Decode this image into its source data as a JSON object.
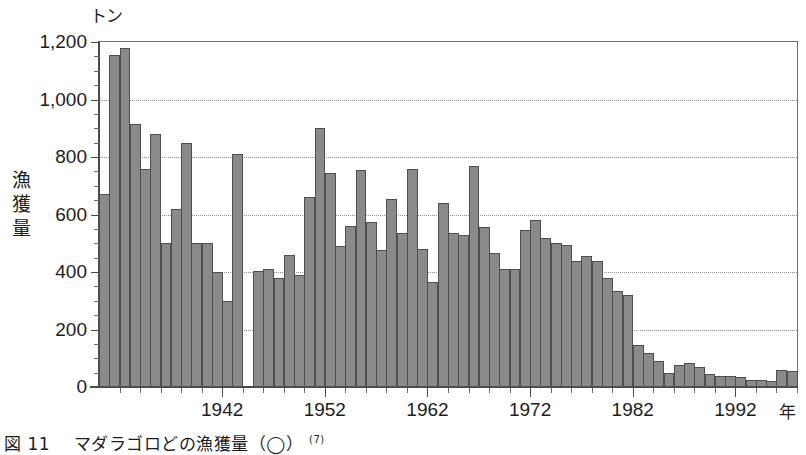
{
  "figure": {
    "caption_number": "図 11",
    "caption_text": "マダラゴロどの漁獲量（◯）",
    "caption_ref": "(7)"
  },
  "chart_data": {
    "type": "bar",
    "title": "",
    "subtitle": "",
    "xlabel": "年",
    "ylabel": "漁獲量",
    "yunit": "トン",
    "xunit": "年",
    "ylim": [
      0,
      1200
    ],
    "ytick_step": 200,
    "yticks": [
      0,
      200,
      400,
      600,
      800,
      1000,
      1200
    ],
    "ytick_labels": [
      "0",
      "200",
      "400",
      "600",
      "800",
      "1,000",
      "1,200"
    ],
    "yminor_step": 50,
    "xlim": [
      1931,
      1999
    ],
    "xticks": [
      1942,
      1952,
      1962,
      1972,
      1982,
      1992
    ],
    "xtick_labels": [
      "1942",
      "1952",
      "1962",
      "1972",
      "1982",
      "1992"
    ],
    "xminor_step": 2,
    "grid": true,
    "grid_axis": "y",
    "legend": "none",
    "bar_color": "#8a8a8a",
    "bar_edge_color": "#4f4f4f",
    "x": [
      1931,
      1932,
      1933,
      1934,
      1935,
      1936,
      1937,
      1938,
      1939,
      1940,
      1941,
      1942,
      1943,
      1944,
      1945,
      1946,
      1947,
      1948,
      1949,
      1950,
      1951,
      1952,
      1953,
      1954,
      1955,
      1956,
      1957,
      1958,
      1959,
      1960,
      1961,
      1962,
      1963,
      1964,
      1965,
      1966,
      1967,
      1968,
      1969,
      1970,
      1971,
      1972,
      1973,
      1974,
      1975,
      1976,
      1977,
      1978,
      1979,
      1980,
      1981,
      1982,
      1983,
      1984,
      1985,
      1986,
      1987,
      1988,
      1989,
      1990,
      1991,
      1992,
      1993,
      1994,
      1995,
      1996,
      1997,
      1998
    ],
    "values": [
      670,
      1155,
      1180,
      915,
      760,
      880,
      500,
      620,
      850,
      500,
      500,
      400,
      300,
      810,
      0,
      405,
      410,
      380,
      460,
      390,
      660,
      900,
      745,
      490,
      560,
      755,
      575,
      475,
      655,
      535,
      760,
      480,
      365,
      640,
      535,
      530,
      770,
      555,
      465,
      410,
      410,
      545,
      580,
      520,
      500,
      495,
      440,
      455,
      440,
      380,
      335,
      320,
      145,
      120,
      90,
      50,
      75,
      85,
      70,
      45,
      40,
      40,
      35,
      25,
      25,
      20,
      60,
      55
    ]
  }
}
